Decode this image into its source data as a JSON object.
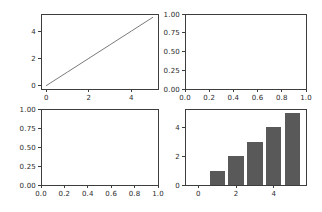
{
  "figure": {
    "kind": "matplotlib-style multi-panel figure",
    "rows": 2,
    "cols": 2,
    "background": "#ffffff"
  },
  "colors": {
    "background": "#ffffff",
    "spine": "#3d3d3d",
    "tick": "#3d3d3d",
    "tick_label": "#2a2a2a",
    "line": "#7a7a7a",
    "bar": "#595959"
  },
  "tick_font_size_px": 7,
  "chart_data": [
    {
      "type": "line",
      "position": "top-left",
      "title": "",
      "xlabel": "",
      "ylabel": "",
      "x": [
        0,
        1,
        2,
        3,
        4,
        5
      ],
      "y": [
        0,
        1,
        2,
        3,
        4,
        5
      ],
      "xlim": [
        -0.25,
        5.25
      ],
      "ylim": [
        -0.25,
        5.25
      ],
      "xticks": [
        0,
        2,
        4
      ],
      "xticklabels": [
        "0",
        "2",
        "4"
      ],
      "yticks": [
        0,
        2,
        4
      ],
      "yticklabels": [
        "0",
        "2",
        "4"
      ],
      "grid": false,
      "legend": false
    },
    {
      "type": "line",
      "position": "top-right",
      "title": "",
      "xlabel": "",
      "ylabel": "",
      "x": [],
      "y": [],
      "xlim": [
        0,
        1
      ],
      "ylim": [
        0,
        1
      ],
      "xticks": [
        0,
        0.2,
        0.4,
        0.6,
        0.8,
        1.0
      ],
      "xticklabels": [
        "0.0",
        "0.2",
        "0.4",
        "0.6",
        "0.8",
        "1.0"
      ],
      "yticks": [
        0,
        0.25,
        0.5,
        0.75,
        1.0
      ],
      "yticklabels": [
        "0.00",
        "0.25",
        "0.50",
        "0.75",
        "1.00"
      ],
      "grid": false,
      "legend": false
    },
    {
      "type": "line",
      "position": "bottom-left",
      "title": "",
      "xlabel": "",
      "ylabel": "",
      "x": [],
      "y": [],
      "xlim": [
        0,
        1
      ],
      "ylim": [
        0,
        1
      ],
      "xticks": [
        0,
        0.2,
        0.4,
        0.6,
        0.8,
        1.0
      ],
      "xticklabels": [
        "0.0",
        "0.2",
        "0.4",
        "0.6",
        "0.8",
        "1.0"
      ],
      "yticks": [
        0,
        0.25,
        0.5,
        0.75,
        1.0
      ],
      "yticklabels": [
        "0.00",
        "0.25",
        "0.50",
        "0.75",
        "1.00"
      ],
      "grid": false,
      "legend": false
    },
    {
      "type": "bar",
      "position": "bottom-right",
      "title": "",
      "xlabel": "",
      "ylabel": "",
      "categories": [
        0,
        1,
        2,
        3,
        4,
        5
      ],
      "values": [
        0,
        1,
        2,
        3,
        4,
        5
      ],
      "bar_width": 0.8,
      "xlim": [
        -0.7,
        5.7
      ],
      "ylim": [
        0,
        5.25
      ],
      "xticks": [
        0,
        2,
        4
      ],
      "xticklabels": [
        "0",
        "2",
        "4"
      ],
      "yticks": [
        0,
        2,
        4
      ],
      "yticklabels": [
        "0",
        "2",
        "4"
      ],
      "grid": false,
      "legend": false
    }
  ]
}
